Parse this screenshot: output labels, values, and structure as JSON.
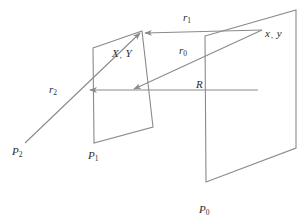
{
  "figure": {
    "type": "optics-propagation-geometry",
    "stroke_color": "#8a8a8a",
    "text_color": "#2b2b2b",
    "background": "#ffffff"
  },
  "planes": [
    {
      "id": "plane-p1",
      "label_base": "P",
      "label_sub": "1",
      "label_x": 88,
      "label_y": 150,
      "points": "93,48 142,31 153,127 94,143"
    },
    {
      "id": "plane-p0",
      "label_base": "P",
      "label_sub": "0",
      "label_x": 199,
      "label_y": 204,
      "points": "205,36 296,10 296,148 206,182"
    }
  ],
  "vectors": [
    {
      "id": "vector-r1",
      "label_base": "r",
      "label_sub": "1",
      "label_x": 183,
      "label_y": 12,
      "from_x": 262,
      "from_y": 30,
      "to_x": 145,
      "to_y": 33
    },
    {
      "id": "vector-r0",
      "label_base": "r",
      "label_sub": "0",
      "label_x": 179,
      "label_y": 45,
      "from_x": 262,
      "from_y": 30,
      "to_x": 134,
      "to_y": 89
    },
    {
      "id": "vector-r2",
      "label_base": "r",
      "label_sub": "2",
      "label_x": 49,
      "label_y": 84,
      "from_x": 25,
      "from_y": 143,
      "to_x": 140,
      "to_y": 33
    },
    {
      "id": "vector-R",
      "label_base": "R",
      "label_sub": "",
      "label_x": 196,
      "label_y": 79,
      "from_x": 258,
      "from_y": 90,
      "to_x": 90,
      "to_y": 90
    }
  ],
  "point_labels": [
    {
      "id": "label-XY",
      "first": "X",
      "second": "Y",
      "x": 112,
      "y": 48
    },
    {
      "id": "label-xy",
      "first": "x",
      "second": "y",
      "x": 265,
      "y": 28
    },
    {
      "id": "label-P2",
      "base": "P",
      "sub": "2",
      "x": 12,
      "y": 146
    }
  ]
}
